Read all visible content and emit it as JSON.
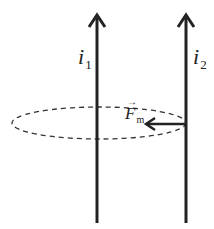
{
  "diagram": {
    "wire1": {
      "label": "i",
      "subscript": "1"
    },
    "wire2": {
      "label": "i",
      "subscript": "2"
    },
    "force": {
      "label": "F",
      "subscript": "m",
      "vector_arrow": "→"
    },
    "field_loop": "dashed ellipse around wire 1",
    "colors": {
      "line": "#222222",
      "background": "#ffffff"
    }
  }
}
